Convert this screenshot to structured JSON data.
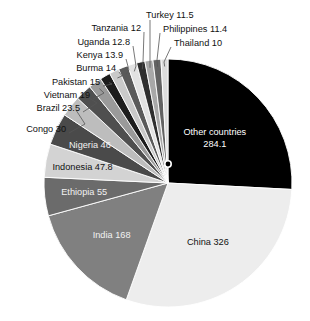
{
  "chart_data": {
    "type": "pie",
    "title": "",
    "subtitle": "",
    "unit": "millions",
    "start_angle_deg": 0,
    "direction": "clockwise",
    "legend": "none",
    "total": 1100.0,
    "categories": [
      "Other countries",
      "China",
      "India",
      "Ethiopia",
      "Indonesia",
      "Nigeria",
      "Congo",
      "Brazil",
      "Vietnam",
      "Pakistan",
      "Burma",
      "Kenya",
      "Uganda",
      "Tanzania",
      "Turkey",
      "Philippines",
      "Thailand"
    ],
    "values": [
      284.1,
      326,
      168,
      55,
      47.8,
      46,
      30,
      23.5,
      19,
      15,
      14,
      13.9,
      12.8,
      12,
      11.5,
      11.4,
      10
    ],
    "slices": [
      {
        "name": "Other countries",
        "value": 284.1,
        "label": "Other countries",
        "value_text": "284.1",
        "color": "#000000",
        "text_color": "#ffffff",
        "label_placement": "inside",
        "line1": "Other countries",
        "line2": "284.1"
      },
      {
        "name": "China",
        "value": 326,
        "label": "China 326",
        "value_text": "326",
        "color": "#ededed",
        "text_color": "#111111",
        "label_placement": "inside",
        "line1": "China 326",
        "line2": ""
      },
      {
        "name": "India",
        "value": 168,
        "label": "India 168",
        "value_text": "168",
        "color": "#808080",
        "text_color": "#f2f2f2",
        "label_placement": "inside",
        "line1": "India 168",
        "line2": ""
      },
      {
        "name": "Ethiopia",
        "value": 55,
        "label": "Ethiopia 55",
        "value_text": "55",
        "color": "#6b6b6b",
        "text_color": "#f2f2f2",
        "label_placement": "inside",
        "line1": "Ethiopia 55",
        "line2": ""
      },
      {
        "name": "Indonesia",
        "value": 47.8,
        "label": "Indonesia 47.8",
        "value_text": "47.8",
        "color": "#d3d3d3",
        "text_color": "#111111",
        "label_placement": "inside",
        "line1": "Indonesia 47.8",
        "line2": ""
      },
      {
        "name": "Nigeria",
        "value": 46,
        "label": "Nigeria 46",
        "value_text": "46",
        "color": "#4a4a4a",
        "text_color": "#f2f2f2",
        "label_placement": "inside",
        "line1": "Nigeria 46",
        "line2": ""
      },
      {
        "name": "Congo",
        "value": 30,
        "label": "Congo 30",
        "value_text": "30",
        "color": "#bdbdbd",
        "text_color": "#111111",
        "label_placement": "callout",
        "line1": "Congo 30",
        "line2": ""
      },
      {
        "name": "Brazil",
        "value": 23.5,
        "label": "Brazil 23.5",
        "value_text": "23.5",
        "color": "#4f4f4f",
        "text_color": "#111111",
        "label_placement": "callout",
        "line1": "Brazil 23.5",
        "line2": ""
      },
      {
        "name": "Vietnam",
        "value": 19,
        "label": "Vietnam 19",
        "value_text": "19",
        "color": "#9a9a9a",
        "text_color": "#111111",
        "label_placement": "callout",
        "line1": "Vietnam 19",
        "line2": ""
      },
      {
        "name": "Pakistan",
        "value": 15,
        "label": "Pakistan 15",
        "value_text": "15",
        "color": "#1c1c1c",
        "text_color": "#111111",
        "label_placement": "callout",
        "line1": "Pakistan 15",
        "line2": ""
      },
      {
        "name": "Burma",
        "value": 14,
        "label": "Burma 14",
        "value_text": "14",
        "color": "#c9c9c9",
        "text_color": "#111111",
        "label_placement": "callout",
        "line1": "Burma 14",
        "line2": ""
      },
      {
        "name": "Kenya",
        "value": 13.9,
        "label": "Kenya 13.9",
        "value_text": "13.9",
        "color": "#5a5a5a",
        "text_color": "#111111",
        "label_placement": "callout",
        "line1": "Kenya 13.9",
        "line2": ""
      },
      {
        "name": "Uganda",
        "value": 12.8,
        "label": "Uganda 12.8",
        "value_text": "12.8",
        "color": "#e2e2e2",
        "text_color": "#111111",
        "label_placement": "callout",
        "line1": "Uganda 12.8",
        "line2": ""
      },
      {
        "name": "Tanzania",
        "value": 12,
        "label": "Tanzania 12",
        "value_text": "12",
        "color": "#2e2e2e",
        "text_color": "#111111",
        "label_placement": "callout",
        "line1": "Tanzania 12",
        "line2": ""
      },
      {
        "name": "Turkey",
        "value": 11.5,
        "label": "Turkey 11.5",
        "value_text": "11.5",
        "color": "#a8a8a8",
        "text_color": "#111111",
        "label_placement": "callout",
        "line1": "Turkey 11.5",
        "line2": ""
      },
      {
        "name": "Philippines",
        "value": 11.4,
        "label": "Philippines 11.4",
        "value_text": "11.4",
        "color": "#636363",
        "text_color": "#111111",
        "label_placement": "callout",
        "line1": "Philippines 11.4",
        "line2": ""
      },
      {
        "name": "Thailand",
        "value": 10,
        "label": "Thailand 10",
        "value_text": "10",
        "color": "#dcdcdc",
        "text_color": "#111111",
        "label_placement": "callout",
        "line1": "Thailand 10",
        "line2": ""
      }
    ],
    "marker": {
      "name": "boundary-dot",
      "present": true,
      "color": "#000000"
    }
  },
  "geometry": {
    "cx": 168,
    "cy": 183,
    "r": 124
  }
}
